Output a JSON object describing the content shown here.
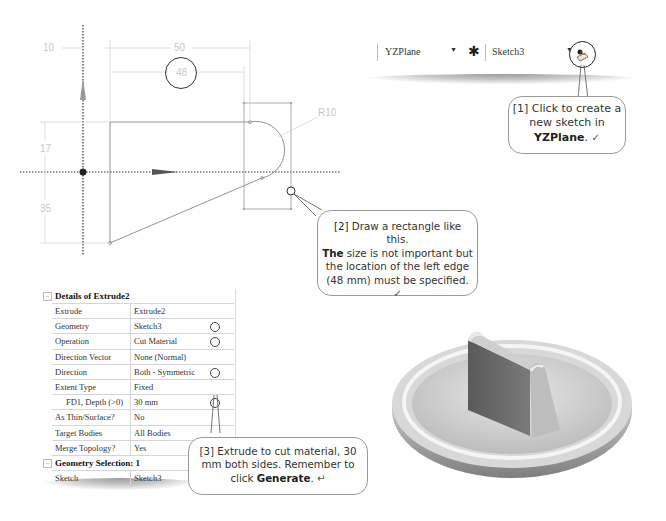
{
  "sketch": {
    "dimensions": {
      "d10": "10",
      "d50": "50",
      "d48": "48",
      "r10": "R10",
      "d17": "17",
      "d35": "35"
    },
    "highlighted_dimension": "48"
  },
  "toolbar": {
    "plane_select": "YZPlane",
    "sketch_select": "Sketch3",
    "new_sketch_icon": "new-sketch-icon",
    "axis_icon": "axis-icon"
  },
  "callouts": {
    "c1": {
      "prefix": "[1] Click to create a new sketch in ",
      "bold": "YZPlane",
      "suffix": ".",
      "mark": "✓"
    },
    "c2": {
      "bold_num": "[2]",
      "line1": " Draw a rectangle like this.",
      "bold_the": "The",
      "line2": " size is not important but the location of the left edge (48 mm) must be specified.",
      "mark": "✓"
    },
    "c3": {
      "prefix": "[3] Extrude to cut material, 30 mm both sides.  Remember to click ",
      "bold": "Generate",
      "suffix": ".",
      "mark": "↵"
    }
  },
  "details": {
    "title": "Details of Extrude2",
    "rows": [
      {
        "key": "Extrude",
        "value": "Extrude2",
        "marked": false
      },
      {
        "key": "Geometry",
        "value": "Sketch3",
        "marked": true
      },
      {
        "key": "Operation",
        "value": "Cut Material",
        "marked": true
      },
      {
        "key": "Direction Vector",
        "value": "None (Normal)",
        "marked": false
      },
      {
        "key": "Direction",
        "value": "Both - Symmetric",
        "marked": true
      },
      {
        "key": "Extent Type",
        "value": "Fixed",
        "marked": false
      },
      {
        "key": "FD1, Depth (>0)",
        "value": "30 mm",
        "marked": true
      },
      {
        "key": "As Thin/Surface?",
        "value": "No",
        "marked": false
      },
      {
        "key": "Target Bodies",
        "value": "All Bodies",
        "marked": false
      },
      {
        "key": "Merge Topology?",
        "value": "Yes",
        "marked": false
      }
    ],
    "group2_title": "Geometry Selection: 1",
    "group2_rows": [
      {
        "key": "Sketch",
        "value": "Sketch3"
      }
    ]
  },
  "model": {
    "description": "3D model: circular plate with rim and cut-out block"
  }
}
